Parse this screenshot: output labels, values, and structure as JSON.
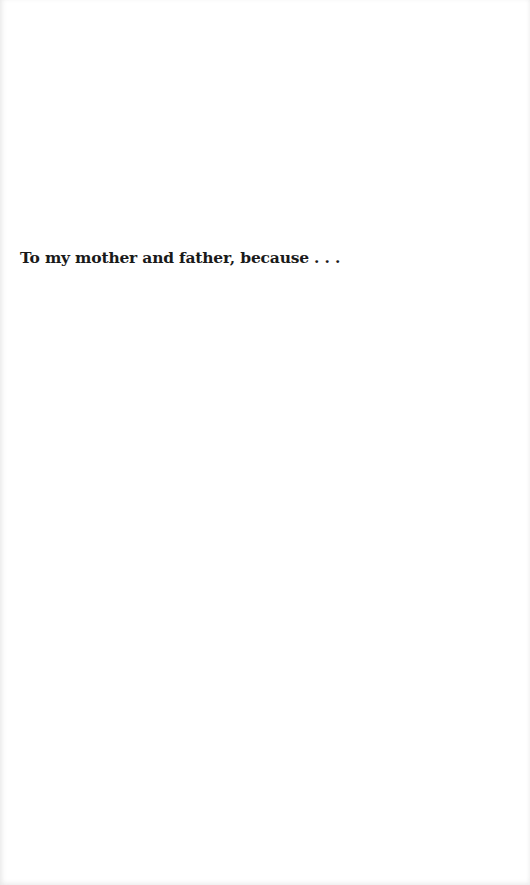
{
  "page": {
    "dedication": "To my mother and father, because . . ."
  }
}
